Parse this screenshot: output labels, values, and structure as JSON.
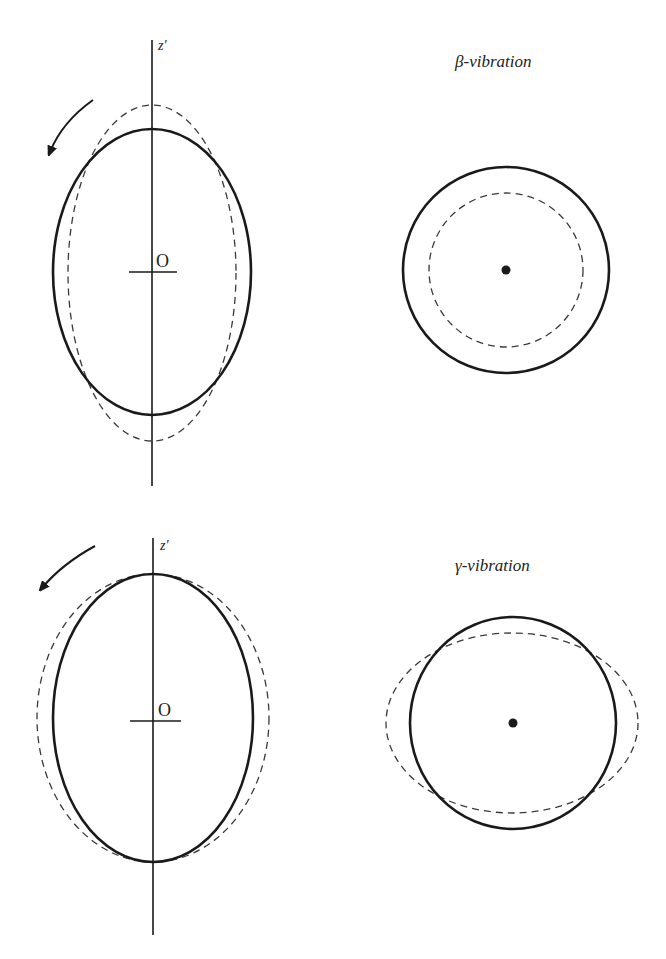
{
  "panels": [
    {
      "id": "beta",
      "title": "β-vibration",
      "axis_label": "z′",
      "origin_label": "O",
      "side_view": {
        "axis": {
          "x": 152,
          "y1": 40,
          "y2": 486
        },
        "origin_tick": {
          "x1": 129,
          "x2": 177,
          "y": 272
        },
        "solid_ellipse": {
          "cx": 152,
          "cy": 272,
          "rx": 99,
          "ry": 143
        },
        "dashed_ellipse": {
          "cx": 152,
          "cy": 273,
          "rx": 84,
          "ry": 168
        },
        "rotation_arrow": {
          "start": [
            93,
            100
          ],
          "tip": [
            47,
            158
          ]
        }
      },
      "end_view": {
        "center": [
          506,
          270
        ],
        "solid_circle_r": 103,
        "dashed_circle_r": 77
      }
    },
    {
      "id": "gamma",
      "title": "γ-vibration",
      "axis_label": "z′",
      "origin_label": "O",
      "side_view": {
        "axis": {
          "x": 153,
          "y1": 538,
          "y2": 935
        },
        "origin_tick": {
          "x1": 130,
          "x2": 181,
          "y": 721
        },
        "solid_ellipse": {
          "cx": 153,
          "cy": 718,
          "rx": 100,
          "ry": 144
        },
        "dashed_ellipse": {
          "cx": 153,
          "cy": 718,
          "rx": 116,
          "ry": 144
        },
        "rotation_arrow": {
          "start": [
            95,
            546
          ],
          "tip": [
            39,
            594
          ]
        }
      },
      "end_view": {
        "center": [
          513,
          723
        ],
        "solid_circle_r": 104,
        "dashed_ellipse_rx": 126,
        "dashed_ellipse_ry": 90
      }
    }
  ],
  "colors": {
    "stroke": "#1a1a1a",
    "dashed": "#3a3a3a"
  }
}
